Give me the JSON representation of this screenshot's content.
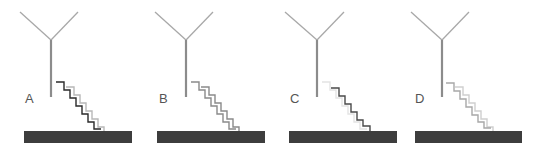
{
  "figure": {
    "panels": [
      {
        "label": "A",
        "front_stair_color": "#2a2a2a",
        "back_stair_color": "#b8b8b8"
      },
      {
        "label": "B",
        "front_stair_color": "#8a8a8a",
        "back_stair_color": "#8a8a8a"
      },
      {
        "label": "C",
        "front_stair_color": "#4a4a4a",
        "back_stair_color": "#e4e4e4"
      },
      {
        "label": "D",
        "front_stair_color": "#a8a8a8",
        "back_stair_color": "#cfcfcf"
      }
    ],
    "colors": {
      "antenna": "#a0a0a0",
      "stem": "#8c8c8c",
      "ground": "#3d3d3d",
      "label": "#555555"
    }
  }
}
